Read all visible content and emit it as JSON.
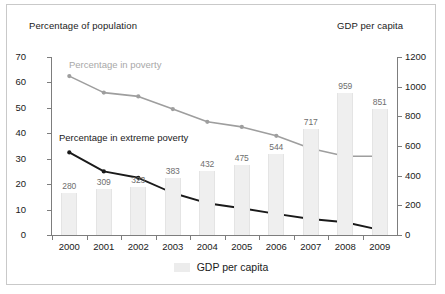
{
  "captions": {
    "left_axis": "Percentage of population",
    "right_axis": "GDP per capita"
  },
  "legend": {
    "label": "GDP per capita",
    "swatch_color": "#ececec"
  },
  "annotations": {
    "poverty": "Percentage in poverty",
    "extreme_poverty": "Percentage in extreme poverty"
  },
  "colors": {
    "poverty_line": "#9e9e9e",
    "extreme_line": "#1a1a1a",
    "bar_fill": "#efefef",
    "axis": "#7d7d7d",
    "frame": "#c9c9c9",
    "bar_label": "#6e6e6e"
  },
  "chart_data": {
    "type": "bar",
    "title": "",
    "xlabel": "",
    "ylabel": "Percentage of population",
    "y2label": "GDP per capita",
    "categories": [
      "2000",
      "2001",
      "2002",
      "2003",
      "2004",
      "2005",
      "2006",
      "2007",
      "2008",
      "2009"
    ],
    "ylim": [
      0,
      70
    ],
    "yticks": [
      0,
      10,
      20,
      30,
      40,
      50,
      60,
      70
    ],
    "y2lim": [
      0,
      1200
    ],
    "y2ticks": [
      0,
      200,
      400,
      600,
      800,
      1000,
      1200
    ],
    "grid": false,
    "legend_position": "bottom-center",
    "series": [
      {
        "name": "GDP per capita",
        "type": "bar",
        "axis": "right",
        "values": [
          280,
          309,
          323,
          383,
          432,
          475,
          544,
          717,
          959,
          851
        ],
        "data_labels": [
          "280",
          "309",
          "323",
          "383",
          "432",
          "475",
          "544",
          "717",
          "959",
          "851"
        ]
      },
      {
        "name": "Percentage in poverty",
        "type": "line",
        "axis": "left",
        "values": [
          62.5,
          56.0,
          54.5,
          49.5,
          44.5,
          42.5,
          39.0,
          34.0,
          31.0,
          31.0
        ]
      },
      {
        "name": "Percentage in extreme poverty",
        "type": "line",
        "axis": "left",
        "values": [
          32.5,
          25.0,
          22.5,
          16.5,
          12.5,
          10.5,
          8.3,
          6.3,
          5.0,
          2.0
        ]
      }
    ]
  }
}
